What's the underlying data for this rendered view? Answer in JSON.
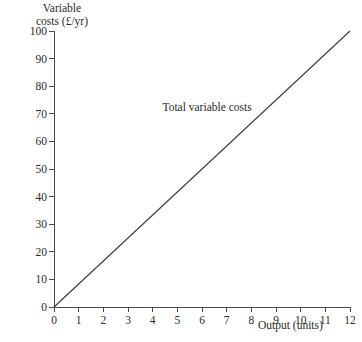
{
  "chart_data": {
    "type": "line",
    "title": "",
    "subtitle": "",
    "xlabel": "Output (units)",
    "ylabel": "Variable costs (£/yr)",
    "ylabel_line1": "Variable",
    "ylabel_line2": "costs (£/yr)",
    "xlim": [
      0,
      12
    ],
    "ylim": [
      0,
      100
    ],
    "xticks": [
      0,
      1,
      2,
      3,
      4,
      5,
      6,
      7,
      8,
      9,
      10,
      11,
      12
    ],
    "xticklabels": [
      "0",
      "1",
      "2",
      "3",
      "4",
      "5",
      "6",
      "7",
      "8",
      "9",
      "10",
      "11",
      "12"
    ],
    "yticks": [
      0,
      10,
      20,
      30,
      40,
      50,
      60,
      70,
      80,
      90,
      100
    ],
    "yticklabels": [
      "0",
      "10",
      "20",
      "30",
      "40",
      "50",
      "60",
      "70",
      "80",
      "90",
      "100"
    ],
    "grid": false,
    "legend": "none",
    "annotations": [
      {
        "text": "Total variable costs",
        "x": 6.2,
        "y": 72
      }
    ],
    "series": [
      {
        "name": "Total variable costs",
        "x": [
          0,
          12
        ],
        "values": [
          0,
          100
        ],
        "slope": 8.3333,
        "intercept": 0,
        "color": "#3a3a3a",
        "linewidth": 1
      }
    ]
  },
  "style": {
    "background": "#ffffff",
    "axis_color": "#4a4a4a",
    "text_color": "#2b2b2b",
    "line_color": "#3a3a3a"
  }
}
